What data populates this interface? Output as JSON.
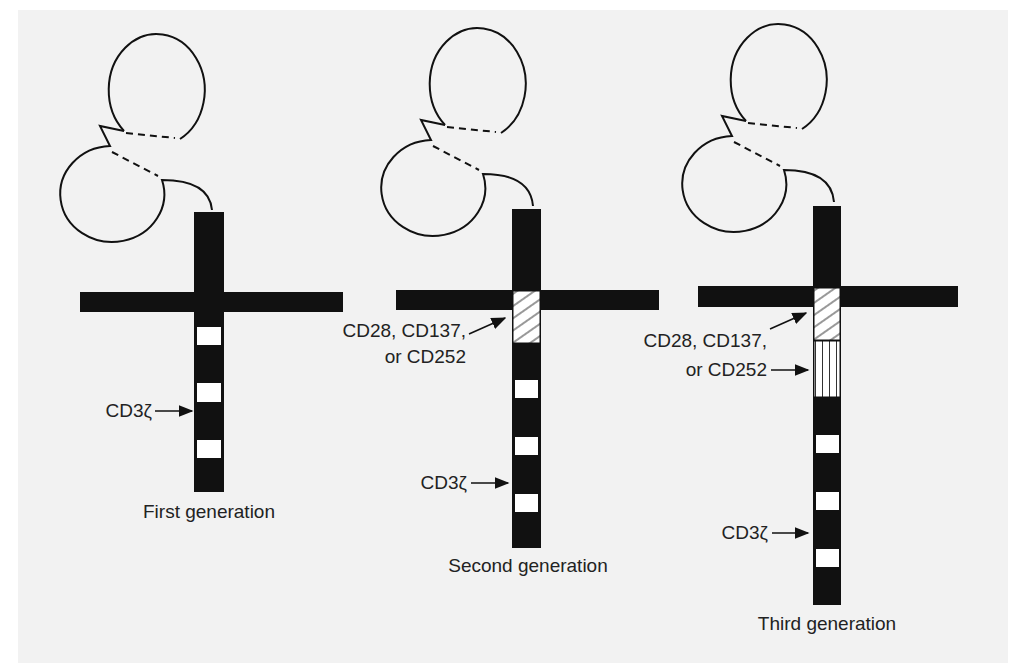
{
  "colors": {
    "panel_bg": "#f2f2f2",
    "ink": "#111111",
    "band": "#ffffff"
  },
  "constructs": [
    {
      "id": "first",
      "caption": "First generation",
      "domains": [
        "scFv",
        "transmembrane",
        "CD3ζ"
      ],
      "labels": {
        "cd3z": "CD3ζ"
      }
    },
    {
      "id": "second",
      "caption": "Second generation",
      "domains": [
        "scFv",
        "transmembrane",
        "costimulatory",
        "CD3ζ"
      ],
      "labels": {
        "costim_line1": "CD28, CD137,",
        "costim_line2": "or CD252",
        "cd3z": "CD3ζ"
      }
    },
    {
      "id": "third",
      "caption": "Third generation",
      "domains": [
        "scFv",
        "transmembrane",
        "costimulatory",
        "costimulatory",
        "CD3ζ"
      ],
      "labels": {
        "costim_line1": "CD28, CD137,",
        "costim_line2": "or CD252",
        "cd3z": "CD3ζ"
      }
    }
  ]
}
